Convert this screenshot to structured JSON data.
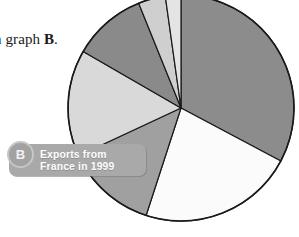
{
  "page": {
    "width": 299,
    "height": 237,
    "background": "#ffffff"
  },
  "caption": {
    "text_prefix": "n graph ",
    "text_bold": "B",
    "text_suffix": "."
  },
  "callout": {
    "badge_letter": "B",
    "line1": "Exports from",
    "line2": "France in 1999",
    "background_color": "#a9a9a9",
    "text_color": "#fdfdfd"
  },
  "chart_data": {
    "type": "pie",
    "title": "Exports from France in 1999",
    "xlabel": "",
    "ylabel": "",
    "legend_position": "none",
    "grid": false,
    "center_x": 181,
    "center_y": 108,
    "radius": 113,
    "outline_color": "#1a1a1a",
    "start_angle_deg": 0,
    "direction": "clockwise",
    "categories": [
      "Slice 1",
      "Slice 2",
      "Slice 3",
      "Slice 4",
      "Slice 5",
      "Slice 6",
      "Slice 7"
    ],
    "values": [
      32.8,
      22.2,
      13.1,
      15.3,
      10.6,
      3.9,
      2.1
    ],
    "angles_deg": [
      118,
      80,
      47,
      55,
      38,
      14,
      8
    ],
    "colors": [
      "#8c8c8c",
      "#fbfbfb",
      "#a0a0a0",
      "#d9d9d9",
      "#8a8a8a",
      "#cfcfcf",
      "#e4e4e4"
    ]
  }
}
